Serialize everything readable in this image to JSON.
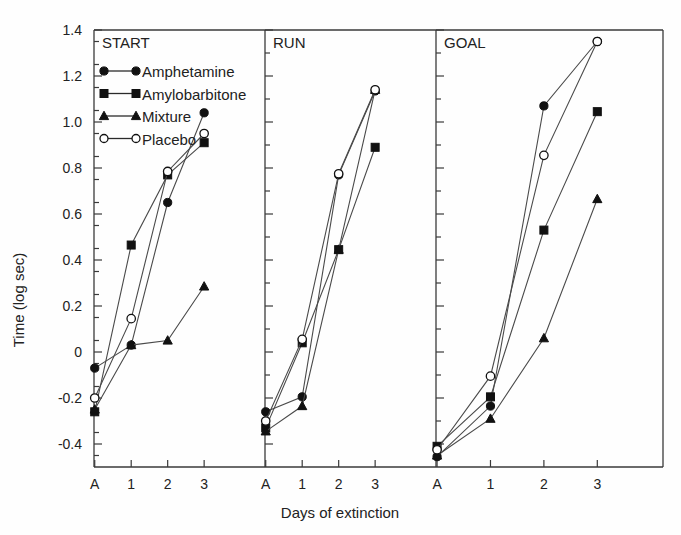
{
  "chart_data": {
    "type": "line",
    "title": "",
    "xlabel": "Days of extinction",
    "ylabel": "Time (log sec)",
    "ylim": [
      -0.5,
      1.4
    ],
    "ytick_labels": [
      "1.4",
      "1.2",
      "1.0",
      "0.8",
      "0.6",
      "0.4",
      "0.2",
      "0",
      "-0.2",
      "-0.4"
    ],
    "ytick_values": [
      1.4,
      1.2,
      1.0,
      0.8,
      0.6,
      0.4,
      0.2,
      0.0,
      -0.2,
      -0.4
    ],
    "minor_tick_step": 0.1,
    "grid": false,
    "categories": [
      "A",
      "1",
      "2",
      "3"
    ],
    "legend_position": "top-left of first panel",
    "legend": [
      {
        "name": "Amphetamine",
        "marker": "filled-circle"
      },
      {
        "name": "Amylobarbitone",
        "marker": "filled-square"
      },
      {
        "name": "Mixture",
        "marker": "filled-triangle"
      },
      {
        "name": "Placebo",
        "marker": "open-circle"
      }
    ],
    "panels": [
      {
        "label": "START",
        "series": [
          {
            "name": "Amphetamine",
            "marker": "filled-circle",
            "values": [
              -0.07,
              0.03,
              0.65,
              1.04
            ]
          },
          {
            "name": "Amylobarbitone",
            "marker": "filled-square",
            "values": [
              -0.26,
              0.465,
              0.77,
              0.91
            ]
          },
          {
            "name": "Mixture",
            "marker": "filled-triangle",
            "values": [
              -0.25,
              0.03,
              0.05,
              0.285
            ]
          },
          {
            "name": "Placebo",
            "marker": "open-circle",
            "values": [
              -0.2,
              0.145,
              0.785,
              0.95
            ]
          }
        ]
      },
      {
        "label": "RUN",
        "series": [
          {
            "name": "Amphetamine",
            "marker": "filled-circle",
            "values": [
              -0.26,
              -0.195,
              0.77,
              1.135
            ]
          },
          {
            "name": "Amylobarbitone",
            "marker": "filled-square",
            "values": [
              -0.33,
              0.04,
              0.445,
              0.89
            ]
          },
          {
            "name": "Mixture",
            "marker": "filled-triangle",
            "values": [
              -0.345,
              -0.235,
              0.445,
              1.14
            ]
          },
          {
            "name": "Placebo",
            "marker": "open-circle",
            "values": [
              -0.3,
              0.055,
              0.775,
              1.14
            ]
          }
        ]
      },
      {
        "label": "GOAL",
        "series": [
          {
            "name": "Amphetamine",
            "marker": "filled-circle",
            "values": [
              -0.455,
              -0.235,
              1.07,
              1.35
            ]
          },
          {
            "name": "Amylobarbitone",
            "marker": "filled-square",
            "values": [
              -0.41,
              -0.195,
              0.53,
              1.045
            ]
          },
          {
            "name": "Mixture",
            "marker": "filled-triangle",
            "values": [
              -0.45,
              -0.29,
              0.06,
              0.665
            ]
          },
          {
            "name": "Placebo",
            "marker": "open-circle",
            "values": [
              -0.425,
              -0.105,
              0.855,
              1.35
            ]
          }
        ]
      }
    ]
  }
}
